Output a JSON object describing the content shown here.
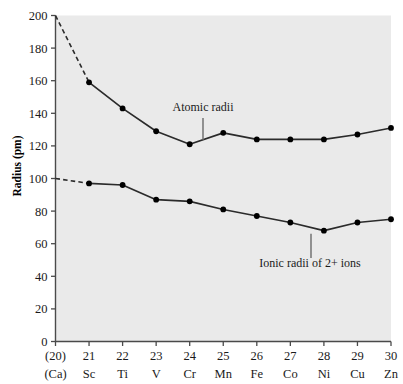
{
  "chart_data": {
    "type": "line",
    "title": "",
    "xlabel": "",
    "ylabel": "Radius (pm)",
    "ylim": [
      0,
      200
    ],
    "ytick_labels": [
      "0",
      "20",
      "40",
      "60",
      "80",
      "100",
      "120",
      "140",
      "160",
      "180",
      "200"
    ],
    "ytick_values": [
      0,
      20,
      40,
      60,
      80,
      100,
      120,
      140,
      160,
      180,
      200
    ],
    "grid": false,
    "legend_position": "inline-annotations",
    "x_atomic_numbers": [
      "(20)",
      "21",
      "22",
      "23",
      "24",
      "25",
      "26",
      "27",
      "28",
      "29",
      "30"
    ],
    "x_symbols": [
      "(Ca)",
      "Sc",
      "Ti",
      "V",
      "Cr",
      "Mn",
      "Fe",
      "Co",
      "Ni",
      "Cu",
      "Zn"
    ],
    "categories": [
      "(Ca)",
      "Sc",
      "Ti",
      "V",
      "Cr",
      "Mn",
      "Fe",
      "Co",
      "Ni",
      "Cu",
      "Zn"
    ],
    "series": [
      {
        "name": "Atomic radii",
        "values": [
          200,
          159,
          143,
          129,
          121,
          128,
          124,
          124,
          124,
          127,
          131
        ],
        "dashed_leading_segment": true,
        "marker_at_first_point": false
      },
      {
        "name": "Ionic radii of 2+ ions",
        "values": [
          100,
          97,
          96,
          87,
          86,
          81,
          77,
          73,
          68,
          73,
          75
        ],
        "dashed_leading_segment": true,
        "marker_at_first_point": false
      }
    ],
    "annotations": [
      {
        "text": "Atomic radii",
        "points_to_category": "Cr-Mn",
        "leader": "down"
      },
      {
        "text": "Ionic radii of 2+ ions",
        "points_to_category": "Ni",
        "leader": "up"
      }
    ],
    "colors": {
      "plot_background": "#eaeaea",
      "line": "#2b2b2b",
      "marker": "#000000",
      "axis": "#4a4a4a",
      "text": "#1a1a1a"
    }
  }
}
